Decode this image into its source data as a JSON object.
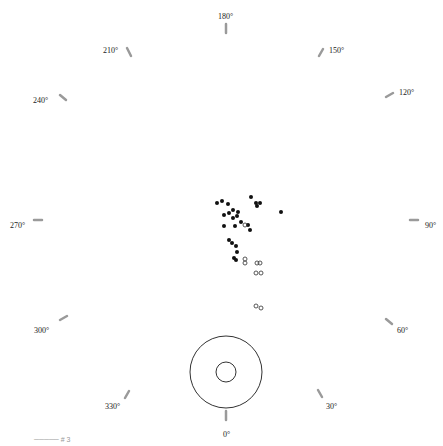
{
  "diagram": {
    "type": "polar-angle-plot",
    "center": {
      "x": 226,
      "y": 223
    },
    "angle_labels": [
      {
        "text": "180°",
        "x": 218,
        "y": 13,
        "tick": {
          "x1": 226,
          "y1": 24,
          "x2": 226,
          "y2": 33
        }
      },
      {
        "text": "150°",
        "x": 329,
        "y": 47,
        "tick": {
          "x1": 323,
          "y1": 49,
          "x2": 319,
          "y2": 56
        }
      },
      {
        "text": "120°",
        "x": 399,
        "y": 89,
        "tick": {
          "x1": 393,
          "y1": 93,
          "x2": 386,
          "y2": 97
        }
      },
      {
        "text": "90°",
        "x": 425,
        "y": 222,
        "tick": {
          "x1": 418,
          "y1": 220,
          "x2": 410,
          "y2": 220
        }
      },
      {
        "text": "60°",
        "x": 397,
        "y": 327,
        "tick": {
          "x1": 392,
          "y1": 324,
          "x2": 386,
          "y2": 319
        }
      },
      {
        "text": "30°",
        "x": 326,
        "y": 403,
        "tick": {
          "x1": 322,
          "y1": 397,
          "x2": 318,
          "y2": 390
        }
      },
      {
        "text": "0°",
        "x": 223,
        "y": 431,
        "tick": {
          "x1": 226,
          "y1": 411,
          "x2": 226,
          "y2": 420
        }
      },
      {
        "text": "330°",
        "x": 105,
        "y": 403,
        "tick": {
          "x1": 129,
          "y1": 391,
          "x2": 125,
          "y2": 398
        }
      },
      {
        "text": "300°",
        "x": 34,
        "y": 327,
        "tick": {
          "x1": 60,
          "y1": 320,
          "x2": 67,
          "y2": 316
        }
      },
      {
        "text": "270°",
        "x": 10,
        "y": 222,
        "tick": {
          "x1": 34,
          "y1": 220,
          "x2": 42,
          "y2": 220
        }
      },
      {
        "text": "240°",
        "x": 33,
        "y": 97,
        "tick": {
          "x1": 60,
          "y1": 95,
          "x2": 66,
          "y2": 100
        }
      },
      {
        "text": "210°",
        "x": 103,
        "y": 47,
        "tick": {
          "x1": 127,
          "y1": 48,
          "x2": 131,
          "y2": 56
        }
      }
    ],
    "target_rings": [
      {
        "cx": 226,
        "cy": 372,
        "r": 36
      },
      {
        "cx": 226,
        "cy": 372,
        "r": 10
      }
    ],
    "filled_points": [
      [
        217,
        203
      ],
      [
        222,
        201
      ],
      [
        228,
        204
      ],
      [
        233,
        210
      ],
      [
        251,
        197
      ],
      [
        256,
        203
      ],
      [
        260,
        203
      ],
      [
        257,
        206
      ],
      [
        281,
        212
      ],
      [
        224,
        215
      ],
      [
        229,
        213
      ],
      [
        233,
        218
      ],
      [
        237,
        216
      ],
      [
        238,
        212
      ],
      [
        241,
        222
      ],
      [
        248,
        225
      ],
      [
        250,
        230
      ],
      [
        224,
        226
      ],
      [
        235,
        226
      ],
      [
        229,
        240
      ],
      [
        232,
        243
      ],
      [
        236,
        246
      ],
      [
        237,
        252
      ],
      [
        234,
        258
      ],
      [
        236,
        260
      ]
    ],
    "hollow_points": [
      [
        245,
        259
      ],
      [
        245,
        263
      ],
      [
        257,
        263
      ],
      [
        260,
        263
      ],
      [
        256,
        273
      ],
      [
        261,
        273
      ],
      [
        256,
        306
      ],
      [
        261,
        308
      ],
      [
        245,
        225
      ]
    ],
    "footer_text": "─────  # 3"
  },
  "colors": {
    "tick": "#9a9a9a",
    "dot": "#111111",
    "ring": "#333333"
  }
}
